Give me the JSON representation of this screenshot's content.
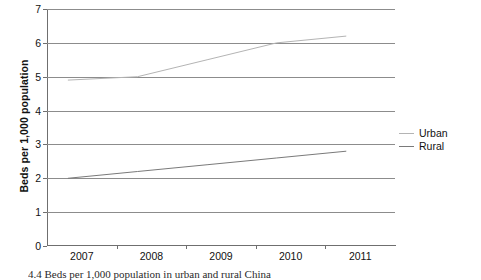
{
  "chart_data": {
    "type": "line",
    "title": "",
    "xlabel": "",
    "ylabel": "Beds per 1,000 population",
    "categories": [
      "2007",
      "2008",
      "2009",
      "2010",
      "2011"
    ],
    "ylim": [
      0,
      7
    ],
    "ytick_labels": [
      "0",
      "1",
      "2",
      "3",
      "4",
      "5",
      "6",
      "7"
    ],
    "ytick_values": [
      0,
      1,
      2,
      3,
      4,
      5,
      6,
      7
    ],
    "grid": "horizontal",
    "legend_position": "right",
    "series": [
      {
        "name": "Urban",
        "color": "#b4b4b4",
        "values": [
          4.9,
          5.0,
          5.5,
          6.0,
          6.2
        ]
      },
      {
        "name": "Rural",
        "color": "#7a7a7a",
        "values": [
          2.0,
          2.2,
          2.4,
          2.6,
          2.8
        ]
      }
    ]
  },
  "legend": {
    "items": [
      {
        "label": "Urban",
        "color": "#b4b4b4"
      },
      {
        "label": "Rural",
        "color": "#7a7a7a"
      }
    ]
  },
  "caption": {
    "text": "4.4  Beds per 1,000 population in urban and rural China"
  }
}
